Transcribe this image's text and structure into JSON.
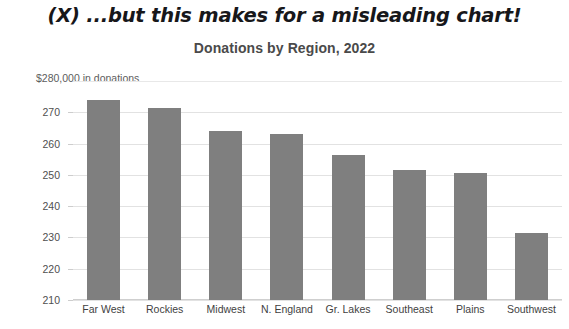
{
  "headline": "(X) ...but this makes for a misleading chart!",
  "axis_caption": "$280,000 in donations",
  "chart_data": {
    "type": "bar",
    "title": "Donations by Region, 2022",
    "xlabel": "",
    "ylabel": "$280,000 in donations",
    "categories": [
      "Far West",
      "Rockies",
      "Midwest",
      "N. England",
      "Gr. Lakes",
      "Southeast",
      "Plains",
      "Southwest"
    ],
    "values": [
      274,
      271.5,
      264,
      263,
      256.5,
      251.5,
      250.5,
      231.5
    ],
    "ylim": [
      210,
      280
    ],
    "yticks": [
      270,
      260,
      250,
      240,
      230,
      220,
      210
    ],
    "ytick_labels": [
      "270",
      "260",
      "250",
      "240",
      "230",
      "220",
      "210"
    ],
    "grid": true,
    "legend": "none",
    "bar_color": "#7f7f7f",
    "units": "thousands of dollars"
  }
}
